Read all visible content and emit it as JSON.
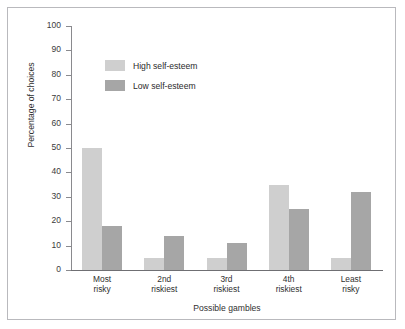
{
  "chart_data": {
    "type": "bar",
    "title": "",
    "xlabel": "Possible gambles",
    "ylabel": "Percentage of choices",
    "categories": [
      "Most risky",
      "2nd riskiest",
      "3rd riskiest",
      "4th riskiest",
      "Least risky"
    ],
    "category_lines": [
      [
        "Most",
        "risky"
      ],
      [
        "2nd",
        "riskiest"
      ],
      [
        "3rd",
        "riskiest"
      ],
      [
        "4th",
        "riskiest"
      ],
      [
        "Least",
        "risky"
      ]
    ],
    "series": [
      {
        "name": "High self-esteem",
        "color": "#cfcfcf",
        "values": [
          50,
          5,
          5,
          35,
          5
        ]
      },
      {
        "name": "Low self-esteem",
        "color": "#a6a6a6",
        "values": [
          18,
          14,
          11,
          25,
          32
        ]
      }
    ],
    "ylim": [
      0,
      100
    ],
    "ytick_step": 10,
    "yticks": [
      0,
      10,
      20,
      30,
      40,
      50,
      60,
      70,
      80,
      90,
      100
    ],
    "ytick_labels": [
      "0",
      "10",
      "20",
      "30",
      "40",
      "50",
      "60",
      "70",
      "80",
      "90",
      "100"
    ],
    "grid": false,
    "legend_position": "upper-left-inside"
  },
  "legend": {
    "items": [
      {
        "label": "High self-esteem"
      },
      {
        "label": "Low self-esteem"
      }
    ]
  },
  "colors": {
    "high_self_esteem": "#cfcfcf",
    "low_self_esteem": "#a6a6a6",
    "axis": "#6f6f73",
    "frame_border": "#b9b9bd",
    "text": "#2f2f2f",
    "background": "#ffffff"
  }
}
